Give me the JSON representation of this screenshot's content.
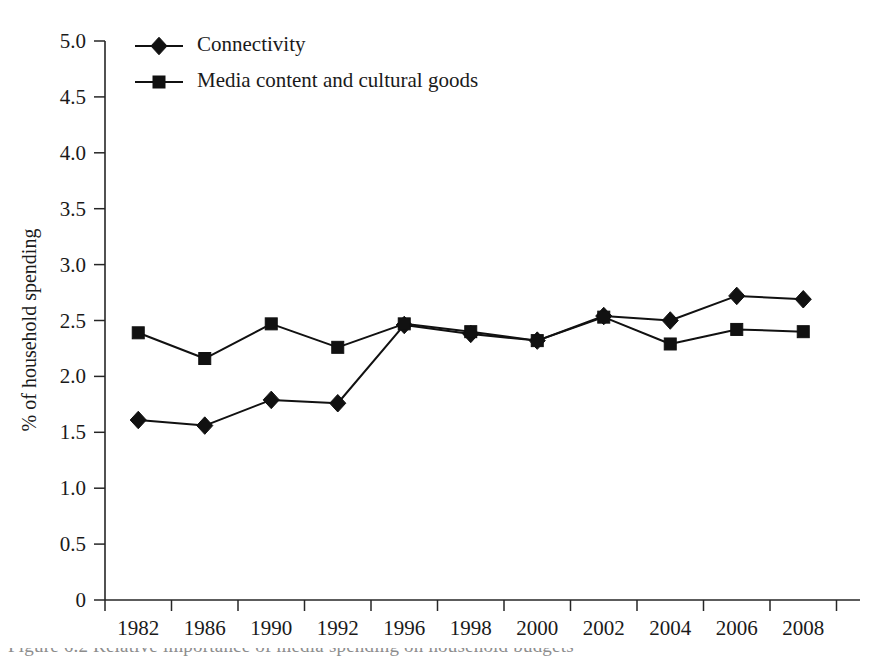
{
  "chart_data": {
    "type": "line",
    "title": "",
    "xlabel": "",
    "ylabel": "% of household spending",
    "categories": [
      "1982",
      "1986",
      "1990",
      "1992",
      "1996",
      "1998",
      "2000",
      "2002",
      "2004",
      "2006",
      "2008"
    ],
    "ylim": [
      0,
      5.0
    ],
    "y_ticks": [
      "0",
      "0.5",
      "1.0",
      "1.5",
      "2.0",
      "2.5",
      "3.0",
      "3.5",
      "4.0",
      "4.5",
      "5.0"
    ],
    "y_tick_values": [
      0,
      0.5,
      1.0,
      1.5,
      2.0,
      2.5,
      3.0,
      3.5,
      4.0,
      4.5,
      5.0
    ],
    "grid": false,
    "legend_position": "top-left",
    "series": [
      {
        "name": "Connectivity",
        "marker": "diamond",
        "color": "#111111",
        "values": [
          1.61,
          1.56,
          1.79,
          1.76,
          2.46,
          2.38,
          2.32,
          2.54,
          2.5,
          2.72,
          2.69
        ]
      },
      {
        "name": "Media content and cultural goods",
        "marker": "square",
        "color": "#111111",
        "values": [
          2.39,
          2.16,
          2.47,
          2.26,
          2.47,
          2.4,
          2.32,
          2.53,
          2.29,
          2.42,
          2.4
        ]
      }
    ]
  },
  "caption": {
    "text": "Figure 6.2  Relative importance of media spending on household budgets"
  }
}
